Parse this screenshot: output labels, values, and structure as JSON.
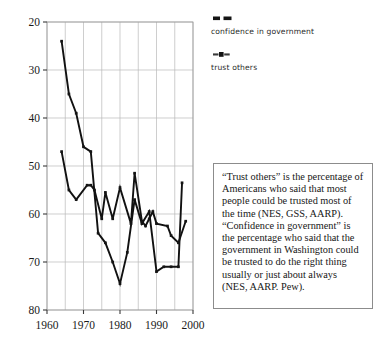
{
  "chart_data": {
    "type": "line",
    "title": "",
    "subtitle": "",
    "xlabel": "",
    "ylabel": "",
    "xlim": [
      1960,
      2000
    ],
    "ylim": [
      20,
      80
    ],
    "x_ticks": [
      1960,
      1970,
      1980,
      1990,
      2000
    ],
    "y_ticks": [
      20,
      30,
      40,
      50,
      60,
      70,
      80
    ],
    "grid": true,
    "legend_position": "right-top",
    "series": [
      {
        "name": "confidence in government",
        "color": "#111111",
        "marker": "square",
        "points": [
          {
            "x": 1964,
            "y": 76.0
          },
          {
            "x": 1966,
            "y": 65.0
          },
          {
            "x": 1968,
            "y": 61.0
          },
          {
            "x": 1970,
            "y": 54.0
          },
          {
            "x": 1972,
            "y": 53.0
          },
          {
            "x": 1974,
            "y": 36.0
          },
          {
            "x": 1976,
            "y": 34.0
          },
          {
            "x": 1978,
            "y": 30.0
          },
          {
            "x": 1980,
            "y": 25.5
          },
          {
            "x": 1982,
            "y": 32.0
          },
          {
            "x": 1984,
            "y": 43.0
          },
          {
            "x": 1986,
            "y": 38.0
          },
          {
            "x": 1988,
            "y": 40.5
          },
          {
            "x": 1990,
            "y": 28.0
          },
          {
            "x": 1992,
            "y": 29.0
          },
          {
            "x": 1994,
            "y": 29.0
          },
          {
            "x": 1996,
            "y": 29.0
          },
          {
            "x": 1997,
            "y": 46.5
          }
        ]
      },
      {
        "name": "trust others",
        "color": "#111111",
        "marker": "square",
        "points": [
          {
            "x": 1964,
            "y": 53.0
          },
          {
            "x": 1966,
            "y": 45.0
          },
          {
            "x": 1968,
            "y": 43.0
          },
          {
            "x": 1971,
            "y": 46.0
          },
          {
            "x": 1972,
            "y": 46.0
          },
          {
            "x": 1973,
            "y": 45.0
          },
          {
            "x": 1975,
            "y": 39.0
          },
          {
            "x": 1976,
            "y": 44.5
          },
          {
            "x": 1978,
            "y": 39.0
          },
          {
            "x": 1980,
            "y": 45.5
          },
          {
            "x": 1983,
            "y": 38.0
          },
          {
            "x": 1984,
            "y": 48.5
          },
          {
            "x": 1986,
            "y": 38.5
          },
          {
            "x": 1987,
            "y": 37.5
          },
          {
            "x": 1988,
            "y": 39.0
          },
          {
            "x": 1989,
            "y": 40.5
          },
          {
            "x": 1990,
            "y": 38.0
          },
          {
            "x": 1993,
            "y": 37.5
          },
          {
            "x": 1994,
            "y": 35.5
          },
          {
            "x": 1996,
            "y": 34.0
          },
          {
            "x": 1998,
            "y": 38.5
          }
        ]
      }
    ]
  },
  "legend": {
    "entries": [
      {
        "label": "confidence in government",
        "swatch_name": "legend-swatch-confidence"
      },
      {
        "label": "trust others",
        "swatch_name": "legend-swatch-trust"
      }
    ]
  },
  "annotation": {
    "text": "“Trust others” is the percentage of Americans who said that most people could be trusted most of the time (NES, GSS, AARP). “Confidence in government” is the percentage who said that the government in Washington could be trusted to do the right thing usually or just about always\n(NES, AARP. Pew)."
  },
  "axes": {
    "y_tick_labels": [
      "80",
      "70",
      "60",
      "50",
      "40",
      "30",
      "20"
    ],
    "x_tick_labels": [
      "1960",
      "1970",
      "1980",
      "1990",
      "2000"
    ]
  },
  "colors": {
    "line": "#111111",
    "grid": "#b9b9b9",
    "frame": "#9a9a9a",
    "text": "#161616",
    "box_border": "#8c8c8c",
    "background": "#ffffff"
  }
}
